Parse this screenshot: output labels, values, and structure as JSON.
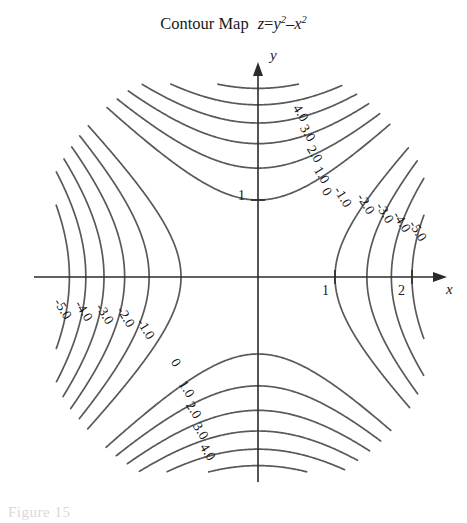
{
  "figure": {
    "title_prefix": "Contour Map",
    "equation": {
      "lhs": "z",
      "eq": "=",
      "term1_base": "y",
      "term1_exp": "2",
      "operator": "–",
      "term2_base": "x",
      "term2_exp": "2"
    },
    "caption": "Figure 15",
    "line_color": "#595959",
    "axis_color": "#2b2b2b",
    "background": "#ffffff"
  },
  "axes": {
    "x_axis_label": "x",
    "y_axis_label": "y",
    "origin_px": [
      258,
      277
    ],
    "unit_px": 77,
    "x_ticks": [
      {
        "value": 1,
        "label": "1"
      },
      {
        "value": 2,
        "label": "2"
      }
    ],
    "y_ticks": [
      {
        "value": 1,
        "label": "1"
      }
    ],
    "x_range": [
      -2.6,
      2.45
    ],
    "y_range": [
      -2.5,
      2.5
    ]
  },
  "chart_data": {
    "type": "line",
    "function": "z = y^2 - x^2",
    "xlabel": "x",
    "ylabel": "y",
    "grid": false,
    "legend": "none",
    "plot_kind": "contour",
    "asymptotes": [
      "y = x",
      "y = -x"
    ],
    "xlim": [
      -2.6,
      2.45
    ],
    "ylim": [
      -2.5,
      2.5
    ],
    "levels": [
      -5,
      -4,
      -3,
      -2,
      -1,
      0,
      1,
      2,
      3,
      4,
      5
    ],
    "contour_labels": {
      "top_branch": [
        "0",
        "1.0",
        "2.0",
        "3.0",
        "4.0"
      ],
      "bottom_branch": [
        "0",
        "1.0",
        "2.0",
        "3.0",
        "4.0"
      ],
      "right_branch": [
        "-1.0",
        "-2.0",
        "-3.0",
        "-4.0",
        "-5.0"
      ],
      "left_branch": [
        "-1.0",
        "-2.0",
        "-3.0",
        "-4.0",
        "-5.0"
      ]
    },
    "labels": [
      {
        "text": "4.0",
        "x": 296,
        "y": 98,
        "rot": 58
      },
      {
        "text": "3.0",
        "x": 303,
        "y": 118,
        "rot": 58
      },
      {
        "text": "2.0",
        "x": 310,
        "y": 139,
        "rot": 58
      },
      {
        "text": "1.0",
        "x": 317,
        "y": 160,
        "rot": 58
      },
      {
        "text": "0",
        "x": 325,
        "y": 181,
        "rot": 58
      },
      {
        "text": "-1.0",
        "x": 337,
        "y": 180,
        "rot": 58
      },
      {
        "text": "-2.0",
        "x": 360,
        "y": 187,
        "rot": 58
      },
      {
        "text": "-3.0",
        "x": 379,
        "y": 196,
        "rot": 58
      },
      {
        "text": "-4.0",
        "x": 396,
        "y": 205,
        "rot": 58
      },
      {
        "text": "-5.0",
        "x": 412,
        "y": 214,
        "rot": 58
      },
      {
        "text": "-5.0",
        "x": 57,
        "y": 292,
        "rot": 58
      },
      {
        "text": "-4.0",
        "x": 78,
        "y": 294,
        "rot": 58
      },
      {
        "text": "-3.0",
        "x": 99,
        "y": 297,
        "rot": 58
      },
      {
        "text": "-2.0",
        "x": 120,
        "y": 300,
        "rot": 58
      },
      {
        "text": "-1.0",
        "x": 140,
        "y": 312,
        "rot": 58
      },
      {
        "text": "0",
        "x": 174,
        "y": 352,
        "rot": 58
      },
      {
        "text": "1.0",
        "x": 182,
        "y": 374,
        "rot": 58
      },
      {
        "text": "2.0",
        "x": 189,
        "y": 395,
        "rot": 58
      },
      {
        "text": "3.0",
        "x": 196,
        "y": 416,
        "rot": 58
      },
      {
        "text": "4.0",
        "x": 203,
        "y": 437,
        "rot": 58
      }
    ]
  }
}
